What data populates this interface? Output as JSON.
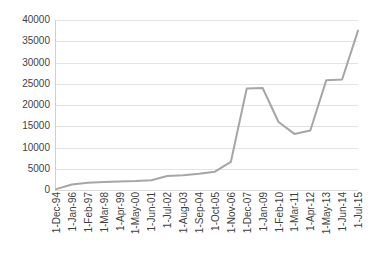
{
  "chart_data": {
    "type": "line",
    "title": "",
    "subtitle": "",
    "xlabel": "",
    "ylabel": "",
    "ylim": [
      0,
      40000
    ],
    "y_ticks": [
      0,
      5000,
      10000,
      15000,
      20000,
      25000,
      30000,
      35000,
      40000
    ],
    "y_tick_labels": [
      "0",
      "5000",
      "10000",
      "15000",
      "20000",
      "25000",
      "30000",
      "35000",
      "40000"
    ],
    "grid": true,
    "grid_axis": "y",
    "legend": false,
    "legend_position": "none",
    "markers": false,
    "line_color": "#a6a6a6",
    "line_width": 2,
    "background_color": "#ffffff",
    "gridline_color": "#e3e3e3",
    "axis_color": "#d0d0d0",
    "tick_label_color": "#3f3f3f",
    "x_tick_rotation": 90,
    "categories": [
      "1-Dec-94",
      "1-Jan-96",
      "1-Feb-97",
      "1-Mar-98",
      "1-Apr-99",
      "1-May-00",
      "1-Jun-01",
      "1-Jul-02",
      "1-Aug-03",
      "1-Sep-04",
      "1-Oct-05",
      "1-Nov-06",
      "1-Dec-07",
      "1-Jan-09",
      "1-Feb-10",
      "1-Mar-11",
      "1-Apr-12",
      "1-May-13",
      "1-Jun-14",
      "1-Jul-15"
    ],
    "values": [
      200,
      1300,
      1700,
      1900,
      2000,
      2100,
      2300,
      3300,
      3500,
      3800,
      4300,
      6600,
      23900,
      24000,
      16000,
      13200,
      14000,
      25800,
      26000,
      37500
    ],
    "annotations": []
  }
}
